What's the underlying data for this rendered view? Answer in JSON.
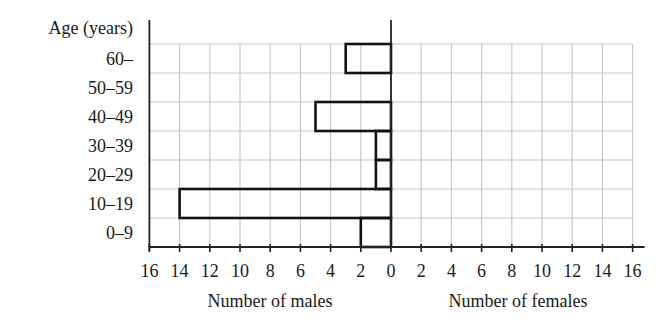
{
  "chart_data": {
    "type": "bar",
    "subtype": "population-pyramid (horizontal, back-to-back)",
    "title": "",
    "y_axis_title": "Age (years)",
    "categories": [
      "60–",
      "50–59",
      "40–49",
      "30–39",
      "20–29",
      "10–19",
      "0–9"
    ],
    "series": [
      {
        "name": "Number of males",
        "side": "left",
        "values": [
          3,
          0,
          5,
          1,
          1,
          14,
          2
        ]
      },
      {
        "name": "Number of females",
        "side": "right",
        "values": [
          null,
          null,
          null,
          null,
          null,
          null,
          null
        ]
      }
    ],
    "xlabel_left": "Number of males",
    "xlabel_right": "Number of females",
    "x_ticks_left": [
      "16",
      "14",
      "12",
      "10",
      "8",
      "6",
      "4",
      "2",
      "0"
    ],
    "x_ticks_right": [
      "2",
      "4",
      "6",
      "8",
      "10",
      "12",
      "14",
      "16"
    ],
    "xlim": [
      0,
      16
    ],
    "grid": true,
    "legend": "none",
    "colors": {
      "bar_outline": "#111111",
      "grid": "#c8c8c8",
      "axis": "#222222"
    }
  }
}
